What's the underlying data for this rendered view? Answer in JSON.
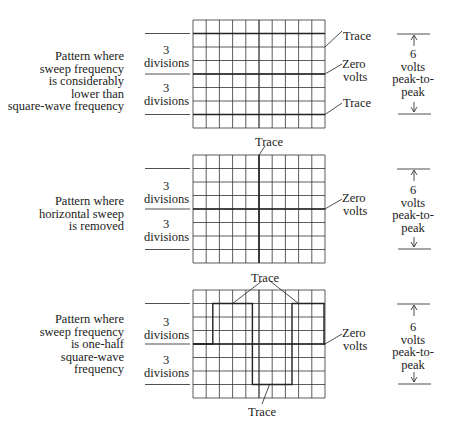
{
  "panels": [
    {
      "description": [
        "Pattern where",
        "sweep frequency",
        "is considerably",
        "lower than",
        "square-wave frequency"
      ],
      "divisions_upper": [
        "3",
        "divisions"
      ],
      "divisions_lower": [
        "3",
        "divisions"
      ],
      "labels": {
        "trace_top": "Trace",
        "zero": [
          "Zero",
          "volts"
        ],
        "trace_bottom": "Trace"
      },
      "voltage": [
        "6",
        "volts",
        "peak-to-",
        "peak"
      ]
    },
    {
      "description": [
        "Pattern where",
        "horizontal sweep",
        "is removed"
      ],
      "divisions_upper": [
        "3",
        "divisions"
      ],
      "divisions_lower": [
        "3",
        "divisions"
      ],
      "labels": {
        "trace_top": "Trace",
        "zero": [
          "Zero",
          "volts"
        ]
      },
      "voltage": [
        "6",
        "volts",
        "peak-to-",
        "peak"
      ]
    },
    {
      "description": [
        "Pattern where",
        "sweep frequency",
        "is one-half",
        "square-wave",
        "frequency"
      ],
      "divisions_upper": [
        "3",
        "divisions"
      ],
      "divisions_lower": [
        "3",
        "divisions"
      ],
      "labels": {
        "trace_top": "Trace",
        "zero": [
          "Zero",
          "volts"
        ],
        "trace_bottom": "Trace"
      },
      "voltage": [
        "6",
        "volts",
        "peak-to-",
        "peak"
      ]
    }
  ],
  "grid": {
    "columns": 10,
    "rows": 8
  },
  "colors": {
    "line": "#222222",
    "grid": "#333333",
    "background": "#ffffff"
  }
}
